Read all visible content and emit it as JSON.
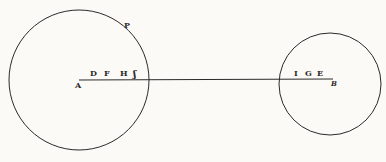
{
  "diagram": {
    "type": "geometric-figure",
    "colors": {
      "ink": "#2a2a2a",
      "paper": "#fbfaf7"
    },
    "labels": {
      "A": "A",
      "B": "B",
      "D": "D",
      "F": "F",
      "H": "H",
      "S": "ʃ",
      "I": "I",
      "G": "G",
      "E": "E",
      "P": "P"
    }
  }
}
